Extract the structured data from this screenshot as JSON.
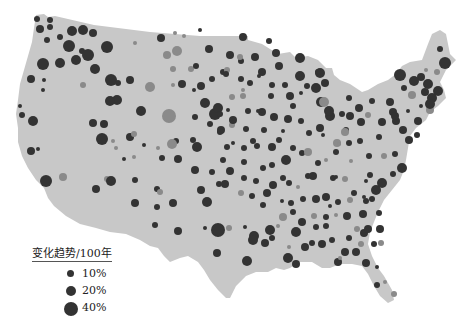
{
  "map": {
    "land_color": "#c8c8c8",
    "positive_color": "#333333",
    "negative_color": "#8a8a8a",
    "description": "Map of contiguous United States with proportional circles showing trend per 100 years"
  },
  "legend": {
    "title": "变化趋势/100年",
    "items": [
      {
        "label": "10%",
        "radius": 3.5
      },
      {
        "label": "20%",
        "radius": 5
      },
      {
        "label": "40%",
        "radius": 7
      }
    ]
  },
  "stations": [
    [
      37,
      19,
      3,
      1
    ],
    [
      50,
      20,
      3,
      1
    ],
    [
      50,
      27,
      3,
      1
    ],
    [
      40,
      29,
      4,
      1
    ],
    [
      60,
      37,
      3,
      1
    ],
    [
      47,
      40,
      3,
      1
    ],
    [
      72,
      31,
      5,
      1
    ],
    [
      83,
      30,
      5,
      1
    ],
    [
      93,
      33,
      4,
      1
    ],
    [
      69,
      46,
      6,
      1
    ],
    [
      82,
      51,
      3,
      1
    ],
    [
      88,
      55,
      6,
      1
    ],
    [
      107,
      47,
      6,
      1
    ],
    [
      135,
      43,
      2,
      0
    ],
    [
      60,
      63,
      5,
      1
    ],
    [
      60,
      64,
      0,
      1
    ],
    [
      43,
      64,
      6,
      1
    ],
    [
      44,
      65,
      0,
      1
    ],
    [
      76,
      60,
      5,
      1
    ],
    [
      95,
      69,
      5,
      1
    ],
    [
      31,
      79,
      4,
      1
    ],
    [
      44,
      80,
      2,
      1
    ],
    [
      83,
      85,
      3,
      0
    ],
    [
      111,
      80,
      6,
      1
    ],
    [
      117,
      100,
      5,
      1
    ],
    [
      110,
      101,
      5,
      1
    ],
    [
      43,
      90,
      2,
      1
    ],
    [
      20,
      106,
      2,
      1
    ],
    [
      22,
      115,
      3,
      1
    ],
    [
      33,
      121,
      5,
      1
    ],
    [
      31,
      151,
      4,
      1
    ],
    [
      38,
      149,
      2,
      1
    ],
    [
      93,
      123,
      4,
      1
    ],
    [
      104,
      124,
      4,
      1
    ],
    [
      130,
      137,
      4,
      1
    ],
    [
      144,
      145,
      2,
      1
    ],
    [
      134,
      134,
      3,
      0
    ],
    [
      116,
      148,
      2,
      0
    ],
    [
      124,
      159,
      2,
      1
    ],
    [
      107,
      179,
      3,
      0
    ],
    [
      46,
      181,
      6,
      1
    ],
    [
      63,
      177,
      4,
      0
    ],
    [
      96,
      189,
      4,
      1
    ],
    [
      111,
      181,
      5,
      1
    ],
    [
      135,
      180,
      3,
      1
    ],
    [
      157,
      189,
      3,
      1
    ],
    [
      135,
      203,
      4,
      1
    ],
    [
      157,
      207,
      3,
      1
    ],
    [
      173,
      203,
      4,
      1
    ],
    [
      178,
      231,
      4,
      1
    ],
    [
      155,
      225,
      3,
      1
    ],
    [
      167,
      55,
      4,
      0
    ],
    [
      177,
      51,
      5,
      0
    ],
    [
      173,
      69,
      3,
      0
    ],
    [
      191,
      69,
      3,
      0
    ],
    [
      182,
      84,
      4,
      1
    ],
    [
      209,
      49,
      4,
      1
    ],
    [
      230,
      55,
      4,
      1
    ],
    [
      255,
      57,
      4,
      1
    ],
    [
      269,
      41,
      3,
      1
    ],
    [
      241,
      61,
      3,
      1
    ],
    [
      223,
      72,
      3,
      1
    ],
    [
      262,
      72,
      4,
      1
    ],
    [
      279,
      66,
      4,
      1
    ],
    [
      300,
      58,
      5,
      1
    ],
    [
      300,
      76,
      5,
      1
    ],
    [
      290,
      96,
      4,
      1
    ],
    [
      227,
      70,
      3,
      0
    ],
    [
      215,
      114,
      6,
      1
    ],
    [
      243,
      96,
      3,
      0
    ],
    [
      232,
      97,
      3,
      0
    ],
    [
      259,
      76,
      2,
      1
    ],
    [
      262,
      112,
      4,
      1
    ],
    [
      274,
      117,
      4,
      1
    ],
    [
      288,
      119,
      4,
      1
    ],
    [
      301,
      121,
      3,
      1
    ],
    [
      246,
      129,
      3,
      1
    ],
    [
      253,
      141,
      3,
      1
    ],
    [
      283,
      131,
      2,
      1
    ],
    [
      262,
      111,
      2,
      1
    ],
    [
      243,
      90,
      2,
      0
    ],
    [
      293,
      106,
      3,
      1
    ],
    [
      201,
      86,
      4,
      1
    ],
    [
      205,
      103,
      5,
      1
    ],
    [
      218,
      108,
      5,
      1
    ],
    [
      220,
      132,
      3,
      1
    ],
    [
      232,
      125,
      3,
      0
    ],
    [
      227,
      147,
      3,
      1
    ],
    [
      257,
      146,
      3,
      1
    ],
    [
      272,
      147,
      4,
      1
    ],
    [
      272,
      165,
      3,
      1
    ],
    [
      286,
      160,
      5,
      1
    ],
    [
      302,
      153,
      3,
      1
    ],
    [
      318,
      163,
      3,
      1
    ],
    [
      289,
      183,
      3,
      1
    ],
    [
      308,
      152,
      4,
      0
    ],
    [
      337,
      143,
      4,
      0
    ],
    [
      326,
      160,
      2,
      0
    ],
    [
      207,
      202,
      5,
      1
    ],
    [
      218,
      230,
      7,
      1
    ],
    [
      217,
      253,
      4,
      1
    ],
    [
      247,
      261,
      5,
      1
    ],
    [
      254,
      236,
      5,
      1
    ],
    [
      245,
      227,
      2,
      1
    ],
    [
      270,
      230,
      5,
      1
    ],
    [
      283,
      217,
      4,
      0
    ],
    [
      293,
      212,
      3,
      1
    ],
    [
      296,
      232,
      5,
      1
    ],
    [
      302,
      222,
      4,
      1
    ],
    [
      305,
      247,
      4,
      1
    ],
    [
      289,
      247,
      2,
      0
    ],
    [
      288,
      258,
      5,
      1
    ],
    [
      296,
      264,
      4,
      1
    ],
    [
      312,
      243,
      3,
      1
    ],
    [
      322,
      244,
      4,
      1
    ],
    [
      316,
      227,
      3,
      1
    ],
    [
      326,
      217,
      3,
      1
    ],
    [
      326,
      226,
      3,
      1
    ],
    [
      332,
      240,
      3,
      1
    ],
    [
      338,
      262,
      4,
      1
    ],
    [
      340,
      258,
      2,
      0
    ],
    [
      345,
      252,
      4,
      1
    ],
    [
      356,
      252,
      4,
      1
    ],
    [
      361,
      244,
      3,
      0
    ],
    [
      364,
      233,
      4,
      1
    ],
    [
      363,
      214,
      4,
      1
    ],
    [
      366,
      201,
      3,
      1
    ],
    [
      376,
      190,
      5,
      1
    ],
    [
      382,
      183,
      5,
      1
    ],
    [
      393,
      174,
      3,
      1
    ],
    [
      402,
      168,
      5,
      1
    ],
    [
      403,
      130,
      4,
      1
    ],
    [
      409,
      140,
      4,
      1
    ],
    [
      393,
      112,
      4,
      1
    ],
    [
      390,
      102,
      4,
      1
    ],
    [
      396,
      121,
      4,
      1
    ],
    [
      372,
      101,
      3,
      1
    ],
    [
      382,
      122,
      4,
      1
    ],
    [
      379,
      137,
      3,
      1
    ],
    [
      369,
      156,
      3,
      1
    ],
    [
      349,
      143,
      3,
      1
    ],
    [
      351,
      161,
      2,
      0
    ],
    [
      370,
      175,
      3,
      1
    ],
    [
      384,
      156,
      3,
      0
    ],
    [
      395,
      154,
      3,
      1
    ],
    [
      417,
      135,
      3,
      1
    ],
    [
      418,
      121,
      4,
      1
    ],
    [
      400,
      75,
      6,
      1
    ],
    [
      421,
      77,
      4,
      1
    ],
    [
      428,
      84,
      5,
      1
    ],
    [
      414,
      81,
      5,
      1
    ],
    [
      425,
      92,
      4,
      1
    ],
    [
      432,
      98,
      5,
      1
    ],
    [
      438,
      91,
      5,
      1
    ],
    [
      421,
      106,
      2,
      1
    ],
    [
      412,
      95,
      4,
      0
    ],
    [
      430,
      110,
      4,
      0
    ],
    [
      445,
      63,
      6,
      1
    ],
    [
      440,
      49,
      3,
      1
    ],
    [
      437,
      72,
      3,
      0
    ],
    [
      430,
      104,
      5,
      1
    ],
    [
      426,
      70,
      2,
      0
    ],
    [
      404,
      88,
      3,
      1
    ],
    [
      395,
      116,
      4,
      1
    ],
    [
      408,
      111,
      2,
      1
    ],
    [
      330,
      116,
      5,
      1
    ],
    [
      342,
      114,
      3,
      1
    ],
    [
      346,
      130,
      3,
      1
    ],
    [
      320,
      128,
      4,
      1
    ],
    [
      321,
      102,
      5,
      1
    ],
    [
      316,
      88,
      5,
      1
    ],
    [
      325,
      83,
      4,
      1
    ],
    [
      324,
      102,
      5,
      0
    ],
    [
      307,
      86,
      3,
      1
    ],
    [
      301,
      93,
      2,
      1
    ],
    [
      320,
      73,
      5,
      1
    ],
    [
      318,
      72,
      3,
      1
    ],
    [
      329,
      111,
      5,
      1
    ],
    [
      350,
      116,
      4,
      1
    ],
    [
      359,
      108,
      4,
      1
    ],
    [
      361,
      122,
      4,
      1
    ],
    [
      368,
      115,
      3,
      0
    ],
    [
      349,
      98,
      3,
      1
    ],
    [
      345,
      132,
      4,
      0
    ],
    [
      339,
      144,
      2,
      0
    ],
    [
      360,
      141,
      3,
      1
    ],
    [
      323,
      135,
      2,
      1
    ],
    [
      313,
      176,
      4,
      1
    ],
    [
      333,
      178,
      3,
      1
    ],
    [
      345,
      179,
      3,
      0
    ],
    [
      366,
      181,
      2,
      1
    ],
    [
      354,
      193,
      3,
      1
    ],
    [
      364,
      197,
      2,
      1
    ],
    [
      372,
      199,
      3,
      1
    ],
    [
      326,
      197,
      4,
      1
    ],
    [
      338,
      202,
      3,
      1
    ],
    [
      350,
      200,
      3,
      0
    ],
    [
      316,
      199,
      4,
      1
    ],
    [
      303,
      199,
      3,
      1
    ],
    [
      291,
      203,
      3,
      1
    ],
    [
      267,
      193,
      4,
      1
    ],
    [
      252,
      196,
      3,
      1
    ],
    [
      241,
      193,
      3,
      0
    ],
    [
      244,
      178,
      3,
      1
    ],
    [
      230,
      171,
      4,
      1
    ],
    [
      225,
      184,
      4,
      1
    ],
    [
      219,
      184,
      3,
      1
    ],
    [
      212,
      172,
      3,
      1
    ],
    [
      195,
      170,
      4,
      1
    ],
    [
      201,
      190,
      4,
      1
    ],
    [
      223,
      160,
      3,
      1
    ],
    [
      244,
      162,
      3,
      1
    ],
    [
      263,
      168,
      3,
      1
    ],
    [
      283,
      178,
      3,
      1
    ],
    [
      308,
      176,
      3,
      1
    ],
    [
      336,
      177,
      2,
      1
    ],
    [
      178,
      159,
      4,
      1
    ],
    [
      162,
      158,
      3,
      1
    ],
    [
      176,
      141,
      3,
      1
    ],
    [
      193,
      140,
      3,
      1
    ],
    [
      197,
      147,
      5,
      1
    ],
    [
      221,
      130,
      4,
      1
    ],
    [
      228,
      110,
      2,
      1
    ],
    [
      210,
      124,
      3,
      1
    ],
    [
      233,
      143,
      2,
      1
    ],
    [
      244,
      148,
      3,
      1
    ],
    [
      264,
      130,
      3,
      1
    ],
    [
      279,
      140,
      3,
      1
    ],
    [
      293,
      148,
      3,
      1
    ],
    [
      336,
      152,
      3,
      1
    ],
    [
      309,
      133,
      3,
      1
    ],
    [
      248,
      111,
      3,
      1
    ],
    [
      258,
      111,
      2,
      1
    ],
    [
      169,
      116,
      7,
      0
    ],
    [
      172,
      144,
      5,
      0
    ],
    [
      195,
      117,
      3,
      1
    ],
    [
      220,
      114,
      3,
      1
    ],
    [
      233,
      120,
      4,
      1
    ],
    [
      250,
      83,
      3,
      1
    ],
    [
      272,
      85,
      3,
      1
    ],
    [
      285,
      85,
      3,
      1
    ],
    [
      271,
      96,
      3,
      1
    ],
    [
      241,
      79,
      3,
      1
    ],
    [
      243,
      37,
      4,
      1
    ],
    [
      276,
      53,
      4,
      1
    ],
    [
      240,
      57,
      3,
      0
    ],
    [
      173,
      85,
      2,
      0
    ],
    [
      196,
      66,
      3,
      1
    ],
    [
      226,
      74,
      3,
      1
    ],
    [
      212,
      79,
      3,
      1
    ],
    [
      194,
      90,
      2,
      1
    ],
    [
      200,
      30,
      2,
      1
    ],
    [
      130,
      80,
      4,
      1
    ],
    [
      118,
      83,
      3,
      1
    ],
    [
      150,
      87,
      5,
      0
    ],
    [
      175,
      33,
      2,
      0
    ],
    [
      161,
      38,
      4,
      1
    ],
    [
      184,
      36,
      2,
      0
    ],
    [
      102,
      139,
      6,
      1
    ],
    [
      113,
      141,
      2,
      0
    ],
    [
      141,
      111,
      5,
      1
    ],
    [
      158,
      148,
      2,
      0
    ],
    [
      134,
      157,
      2,
      0
    ],
    [
      160,
      192,
      3,
      0
    ],
    [
      205,
      228,
      2,
      1
    ],
    [
      229,
      228,
      3,
      0
    ],
    [
      253,
      240,
      5,
      1
    ],
    [
      265,
      243,
      4,
      1
    ],
    [
      272,
      238,
      3,
      1
    ],
    [
      278,
      226,
      2,
      0
    ],
    [
      256,
      181,
      3,
      1
    ],
    [
      273,
      185,
      4,
      1
    ],
    [
      263,
      205,
      3,
      1
    ],
    [
      282,
      201,
      2,
      1
    ],
    [
      298,
      187,
      2,
      0
    ],
    [
      314,
      216,
      3,
      0
    ],
    [
      330,
      206,
      2,
      1
    ],
    [
      336,
      215,
      2,
      0
    ],
    [
      347,
      216,
      4,
      1
    ],
    [
      349,
      238,
      3,
      1
    ],
    [
      357,
      229,
      3,
      0
    ],
    [
      368,
      229,
      4,
      1
    ],
    [
      379,
      213,
      3,
      1
    ],
    [
      380,
      229,
      4,
      1
    ],
    [
      377,
      267,
      2,
      1
    ],
    [
      377,
      285,
      3,
      1
    ],
    [
      385,
      282,
      2,
      0
    ],
    [
      394,
      294,
      3,
      0
    ],
    [
      381,
      243,
      3,
      0
    ],
    [
      366,
      263,
      4,
      1
    ],
    [
      374,
      244,
      3,
      1
    ]
  ]
}
